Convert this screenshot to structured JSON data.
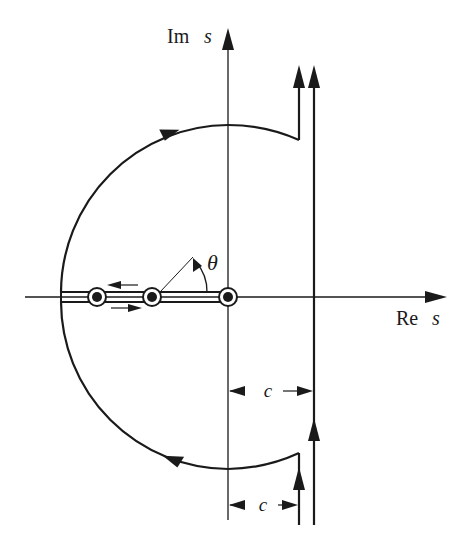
{
  "diagram": {
    "type": "complex-plane contour diagram",
    "axes": {
      "imaginary_label": "Im",
      "imaginary_var": "s",
      "real_label": "Re",
      "real_var": "s"
    },
    "angle_label": "θ",
    "dimension_label_upper": "c",
    "dimension_label_lower": "c",
    "poles": [
      {
        "name": "pole-1",
        "x": 97
      },
      {
        "name": "pole-2",
        "x": 152
      },
      {
        "name": "pole-origin",
        "x": 228
      }
    ],
    "colors": {
      "ink": "#1a1a1a",
      "background": "#ffffff"
    }
  }
}
